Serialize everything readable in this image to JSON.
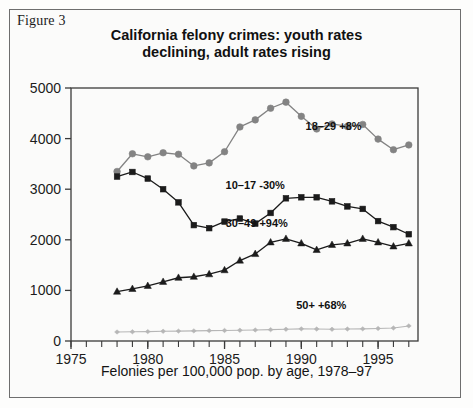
{
  "figure": {
    "caption": "Figure 3"
  },
  "chart_data": {
    "type": "line",
    "title": "California felony crimes: youth rates declining, adult rates rising",
    "title_lines": [
      "California felony crimes: youth rates",
      "declining, adult rates rising"
    ],
    "xlabel": "Felonies per 100,000 pop. by age, 1978–97",
    "ylabel": "",
    "xlim": [
      1975,
      1997.6
    ],
    "ylim": [
      0,
      5000
    ],
    "grid": false,
    "legend_position": "inline-annotations",
    "x_tick_labels": [
      "1975",
      "1980",
      "1985",
      "1990",
      "1995"
    ],
    "x_tick_values": [
      1975,
      1980,
      1985,
      1990,
      1995
    ],
    "x_minor_ticks_every": 1,
    "y_tick_labels": [
      "0",
      "1000",
      "2000",
      "3000",
      "4000",
      "5000"
    ],
    "y_tick_values": [
      0,
      1000,
      2000,
      3000,
      4000,
      5000
    ],
    "x": [
      1978,
      1979,
      1980,
      1981,
      1982,
      1983,
      1984,
      1985,
      1986,
      1987,
      1988,
      1989,
      1990,
      1991,
      1992,
      1993,
      1994,
      1995,
      1996,
      1997
    ],
    "series": [
      {
        "name": "18–29",
        "label": "18–29 +8%",
        "color": "#838383",
        "marker": "circle",
        "label_x": 1992.1,
        "label_y": 4170,
        "values": [
          3350,
          3700,
          3640,
          3720,
          3690,
          3460,
          3520,
          3740,
          4230,
          4370,
          4600,
          4720,
          4440,
          4190,
          4290,
          4240,
          4280,
          3990,
          3780,
          3875
        ]
      },
      {
        "name": "10–17",
        "label": "10–17 -30%",
        "color": "#1b1b1b",
        "marker": "square",
        "label_x": 1987.0,
        "label_y": 3000,
        "values": [
          3250,
          3340,
          3210,
          3000,
          2740,
          2290,
          2230,
          2360,
          2420,
          2320,
          2530,
          2820,
          2840,
          2840,
          2760,
          2660,
          2610,
          2370,
          2250,
          2110
        ]
      },
      {
        "name": "30–49",
        "label": "30–49 +94%",
        "color": "#1b1b1b",
        "marker": "triangle",
        "label_x": 1987.1,
        "label_y": 2250,
        "values": [
          975,
          1030,
          1090,
          1170,
          1250,
          1270,
          1320,
          1400,
          1590,
          1720,
          1950,
          2020,
          1930,
          1800,
          1900,
          1930,
          2020,
          1950,
          1870,
          1930
        ]
      },
      {
        "name": "50+",
        "label": "50+ +68%",
        "color": "#b6b6b6",
        "marker": "diamond",
        "label_x": 1991.3,
        "label_y": 640,
        "values": [
          178,
          182,
          186,
          192,
          196,
          200,
          205,
          208,
          212,
          218,
          224,
          232,
          240,
          236,
          232,
          236,
          240,
          248,
          258,
          298
        ]
      }
    ]
  }
}
